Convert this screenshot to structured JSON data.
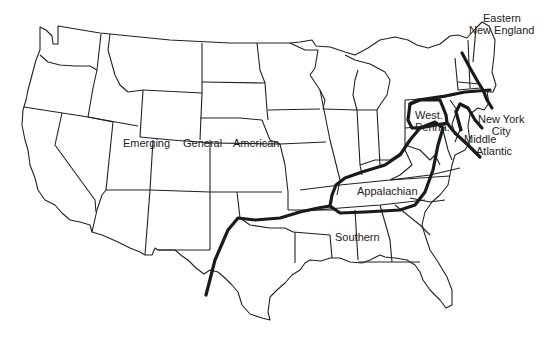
{
  "map": {
    "subject": "Contiguous United States dialect regions",
    "line_color": "#1a1a1a",
    "background": "#ffffff"
  },
  "labels": {
    "eastern_new_england": [
      "Eastern",
      "New England"
    ],
    "west_penna": [
      "West.",
      "Penna."
    ],
    "new_york_city": [
      "New York",
      "City"
    ],
    "middle_atlantic": [
      "Middle",
      "Atlantic"
    ],
    "emerging": "Emerging",
    "general": "General",
    "american": "American",
    "appalachian": "Appalachian",
    "southern": "Southern"
  }
}
